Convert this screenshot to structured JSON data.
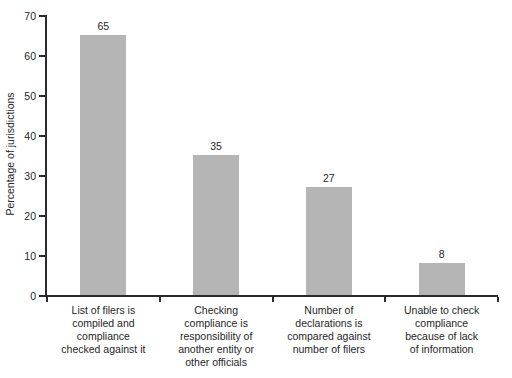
{
  "chart_data": {
    "type": "bar",
    "title": "",
    "xlabel": "",
    "ylabel": "Percentage of jurisdictions",
    "ylim": [
      0,
      70
    ],
    "yticks": [
      0,
      10,
      20,
      30,
      40,
      50,
      60,
      70
    ],
    "grid": false,
    "legend": "none",
    "bar_color": "#b5b5b5",
    "axis_color": "#2b2b2b",
    "text_color": "#262626",
    "categories": [
      "List of filers is compiled and compliance checked against it",
      "Checking compliance is responsibility of another entity or other officials",
      "Number of declarations is compared against number of filers",
      "Unable to check compliance because of lack of information"
    ],
    "category_label_lines": [
      [
        "List of filers is",
        "compiled and",
        "compliance",
        "checked against it"
      ],
      [
        "Checking",
        "compliance is",
        "responsibility of",
        "another entity or",
        "other officials"
      ],
      [
        "Number of",
        "declarations is",
        "compared against",
        "number of filers"
      ],
      [
        "Unable to check",
        "compliance",
        "because of lack",
        "of information"
      ]
    ],
    "values": [
      65,
      35,
      27,
      8
    ],
    "value_labels": [
      "65",
      "35",
      "27",
      "8"
    ]
  }
}
